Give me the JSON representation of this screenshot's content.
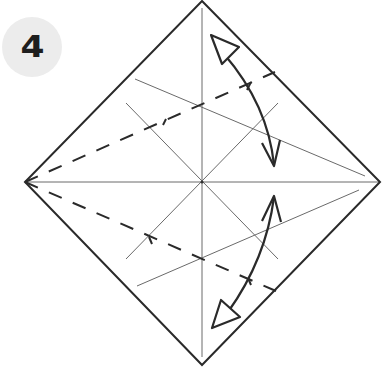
{
  "step": {
    "number": "4",
    "badge_color": "#ececec",
    "text_color": "#1e1e1e"
  },
  "diagram": {
    "type": "origami-fold-instruction",
    "square_orientation": "diamond",
    "corners": {
      "top": [
        202,
        1
      ],
      "right": [
        380,
        182
      ],
      "bottom": [
        202,
        365
      ],
      "left": [
        25,
        182
      ]
    },
    "center": [
      202,
      182
    ],
    "stroke_colors": {
      "outline": "#2a2a2a",
      "crease": "#6a6a6a",
      "valley_fold": "#2a2a2a",
      "arrow": "#2a2a2a"
    },
    "creases": [
      "vertical",
      "horizontal",
      "diagonal-a",
      "diagonal-b",
      "upper-angled",
      "lower-angled"
    ],
    "valley_folds": [
      "upper-dashed-from-left-corner",
      "lower-dashed-from-left-corner"
    ],
    "arrows": [
      "upper-fold-and-unfold-arrow",
      "lower-fold-and-unfold-arrow"
    ]
  }
}
